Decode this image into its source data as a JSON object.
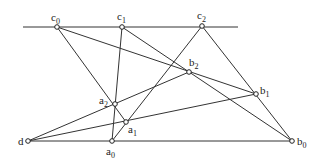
{
  "points": {
    "c0": {
      "x": 57,
      "y": 27,
      "label": "c",
      "sub": "0"
    },
    "c1": {
      "x": 122,
      "y": 27,
      "label": "c",
      "sub": "1"
    },
    "c2": {
      "x": 202,
      "y": 26,
      "label": "c",
      "sub": "2"
    },
    "b2": {
      "x": 189,
      "y": 72,
      "label": "b",
      "sub": "2"
    },
    "b1": {
      "x": 256,
      "y": 94,
      "label": "b",
      "sub": "1"
    },
    "b0": {
      "x": 292,
      "y": 141,
      "label": "b",
      "sub": "0"
    },
    "a2": {
      "x": 115,
      "y": 104,
      "label": "a",
      "sub": "2"
    },
    "a1": {
      "x": 126,
      "y": 122,
      "label": "a",
      "sub": "1"
    },
    "a0": {
      "x": 112,
      "y": 141,
      "label": "a",
      "sub": "0"
    },
    "d": {
      "x": 28,
      "y": 141,
      "label": "d",
      "sub": ""
    }
  },
  "lines": [
    [
      23,
      27,
      238,
      27
    ],
    [
      57,
      27,
      126,
      122
    ],
    [
      57,
      27,
      256,
      94
    ],
    [
      122,
      27,
      112,
      141
    ],
    [
      122,
      27,
      292,
      141
    ],
    [
      202,
      26,
      112,
      141
    ],
    [
      202,
      26,
      292,
      141
    ],
    [
      28,
      141,
      189,
      72
    ],
    [
      28,
      141,
      256,
      94
    ],
    [
      28,
      141,
      292,
      141
    ]
  ]
}
